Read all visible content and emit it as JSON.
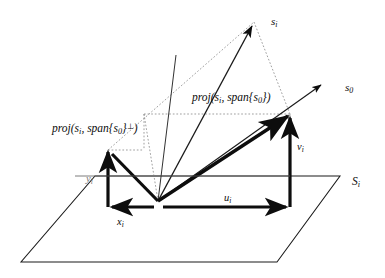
{
  "figure": {
    "type": "vector-projection-diagram",
    "background": "#ffffff",
    "ink": "#0d0d0d",
    "faint_ink": "#7a7a7a",
    "dotted_ink": "#8c8c8c",
    "width": 385,
    "height": 278
  },
  "labels": {
    "s_i": "s",
    "s_i_sub": "i",
    "s_0": "s",
    "s_0_sub": "0",
    "plane": "S",
    "plane_sub": "i",
    "u": "u",
    "u_sub": "i",
    "v": "v",
    "v_sub": "i",
    "x": "x",
    "x_sub": "i",
    "y": "y",
    "y_sub": "i"
  },
  "projection_parallel": {
    "fn": "proj",
    "open": "(",
    "arg1": "s",
    "arg1_sub": "i",
    "sep": ", ",
    "span": "span",
    "brace_open": "{",
    "arg2": "s",
    "arg2_sub": "0",
    "brace_close": "}",
    "close": ")",
    "full_text": "proj(s i , span{s 0 })"
  },
  "projection_perp": {
    "fn": "proj",
    "open": "(",
    "arg1": "s",
    "arg1_sub": "i",
    "sep": ", ",
    "span": "span",
    "brace_open": "{",
    "arg2": "s",
    "arg2_sub": "0",
    "brace_close": "}",
    "perp": "⊥",
    "close": ")",
    "full_text": "proj(s i , span{s 0 } ⊥ )"
  },
  "geometry": {
    "origin": {
      "x": 158,
      "y": 201
    },
    "plane_corners": [
      {
        "x": 95,
        "y": 176
      },
      {
        "x": 340,
        "y": 176
      },
      {
        "x": 277,
        "y": 262
      },
      {
        "x": 21,
        "y": 262
      }
    ],
    "s_i_tip": {
      "x": 254,
      "y": 22
    },
    "s_0_tip": {
      "x": 323,
      "y": 83
    },
    "proj_parallel_point": {
      "x": 290,
      "y": 114
    },
    "proj_perp_point": {
      "x": 108,
      "y": 150
    },
    "u_arrow": {
      "from": {
        "x": 158,
        "y": 207
      },
      "to": {
        "x": 290,
        "y": 207
      }
    },
    "x_arrow": {
      "from": {
        "x": 158,
        "y": 207
      },
      "to": {
        "x": 108,
        "y": 207
      }
    },
    "v_bar": {
      "from": {
        "x": 290,
        "y": 207
      },
      "to": {
        "x": 290,
        "y": 114
      }
    },
    "y_bar": {
      "from": {
        "x": 108,
        "y": 207
      },
      "to": {
        "x": 108,
        "y": 150
      }
    }
  }
}
